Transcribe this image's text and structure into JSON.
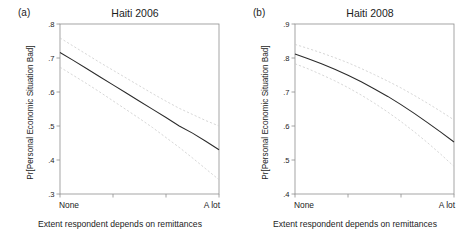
{
  "figure": {
    "panels": [
      {
        "tag": "(a)",
        "title": "Haiti 2006",
        "ylabel": "Pr[Personal Economic Situation Bad]",
        "xlabel": "Extent respondent depends on remittances",
        "yticks": [
          ".8",
          ".7",
          ".6",
          ".5",
          ".4",
          ".3"
        ],
        "xticks": [
          "None",
          "A lot"
        ]
      },
      {
        "tag": "(b)",
        "title": "Haiti 2008",
        "ylabel": "Pr[Personal Economic Situation Bad]",
        "xlabel": "Extent respondent depends on remittances",
        "yticks": [
          ".9",
          ".8",
          ".7",
          ".6",
          ".5",
          ".4"
        ],
        "xticks": [
          "None",
          "A lot"
        ]
      }
    ]
  },
  "chart_data": [
    {
      "type": "line",
      "title": "Haiti 2006",
      "panel_tag": "(a)",
      "xlabel": "Extent respondent depends on remittances",
      "ylabel": "Pr[Personal Economic Situation Bad]",
      "xlim": [
        0,
        3
      ],
      "ylim": [
        0.3,
        0.8
      ],
      "ytick_values": [
        0.8,
        0.7,
        0.6,
        0.5,
        0.4,
        0.3
      ],
      "ytick_labels": [
        ".8",
        ".7",
        ".6",
        ".5",
        ".4",
        ".3"
      ],
      "xtick_values": [
        0,
        1,
        2,
        3
      ],
      "xtick_labels": [
        "None",
        "",
        "",
        "A lot"
      ],
      "grid": false,
      "legend": "none",
      "series": [
        {
          "name": "Predicted probability",
          "style": "solid",
          "color": "#2b2b2b",
          "x": [
            0,
            0.25,
            0.5,
            0.75,
            1,
            1.25,
            1.5,
            1.75,
            2,
            2.25,
            2.5,
            2.75,
            3
          ],
          "values": [
            0.716,
            0.693,
            0.669,
            0.645,
            0.621,
            0.597,
            0.573,
            0.549,
            0.525,
            0.5,
            0.479,
            0.455,
            0.43
          ]
        },
        {
          "name": "Upper 95% confidence bound",
          "style": "dashed",
          "color": "#c9c9c9",
          "x": [
            0,
            0.25,
            0.5,
            0.75,
            1,
            1.25,
            1.5,
            1.75,
            2,
            2.25,
            2.5,
            2.75,
            3
          ],
          "values": [
            0.759,
            0.735,
            0.711,
            0.687,
            0.664,
            0.641,
            0.618,
            0.595,
            0.573,
            0.552,
            0.534,
            0.516,
            0.5
          ]
        },
        {
          "name": "Lower 95% confidence bound",
          "style": "dashed",
          "color": "#c9c9c9",
          "x": [
            0,
            0.25,
            0.5,
            0.75,
            1,
            1.25,
            1.5,
            1.75,
            2,
            2.25,
            2.5,
            2.75,
            3
          ],
          "values": [
            0.673,
            0.649,
            0.625,
            0.6,
            0.574,
            0.548,
            0.522,
            0.495,
            0.466,
            0.437,
            0.406,
            0.374,
            0.342
          ]
        }
      ]
    },
    {
      "type": "line",
      "title": "Haiti 2008",
      "panel_tag": "(b)",
      "xlabel": "Extent respondent depends on remittances",
      "ylabel": "Pr[Personal Economic Situation Bad]",
      "xlim": [
        0,
        3
      ],
      "ylim": [
        0.4,
        0.9
      ],
      "ytick_values": [
        0.9,
        0.8,
        0.7,
        0.6,
        0.5,
        0.4
      ],
      "ytick_labels": [
        ".9",
        ".8",
        ".7",
        ".6",
        ".5",
        ".4"
      ],
      "xtick_values": [
        0,
        1,
        2,
        3
      ],
      "xtick_labels": [
        "None",
        "",
        "",
        "A lot"
      ],
      "grid": false,
      "legend": "none",
      "series": [
        {
          "name": "Predicted probability",
          "style": "solid",
          "color": "#2b2b2b",
          "x": [
            0,
            0.25,
            0.5,
            0.75,
            1,
            1.25,
            1.5,
            1.75,
            2,
            2.25,
            2.5,
            2.75,
            3
          ],
          "values": [
            0.812,
            0.798,
            0.783,
            0.767,
            0.749,
            0.73,
            0.709,
            0.687,
            0.663,
            0.637,
            0.61,
            0.582,
            0.553
          ]
        },
        {
          "name": "Upper 95% confidence bound",
          "style": "dashed",
          "color": "#c9c9c9",
          "x": [
            0,
            0.25,
            0.5,
            0.75,
            1,
            1.25,
            1.5,
            1.75,
            2,
            2.25,
            2.5,
            2.75,
            3
          ],
          "values": [
            0.84,
            0.828,
            0.815,
            0.801,
            0.786,
            0.769,
            0.751,
            0.732,
            0.712,
            0.69,
            0.667,
            0.643,
            0.618
          ]
        },
        {
          "name": "Lower 95% confidence bound",
          "style": "dashed",
          "color": "#c9c9c9",
          "x": [
            0,
            0.25,
            0.5,
            0.75,
            1,
            1.25,
            1.5,
            1.75,
            2,
            2.25,
            2.5,
            2.75,
            3
          ],
          "values": [
            0.783,
            0.768,
            0.751,
            0.733,
            0.713,
            0.691,
            0.667,
            0.641,
            0.613,
            0.583,
            0.551,
            0.517,
            0.481
          ]
        }
      ]
    }
  ]
}
